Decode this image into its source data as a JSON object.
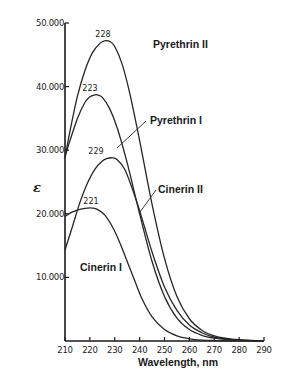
{
  "chart_data": {
    "type": "line",
    "title": "",
    "xlabel": "Wavelength, nm",
    "ylabel": "ε",
    "xlim": [
      210,
      290
    ],
    "ylim": [
      0,
      50000
    ],
    "x_ticks": [
      210,
      220,
      230,
      240,
      250,
      260,
      270,
      280,
      290
    ],
    "x_tick_labels": [
      "210",
      "220",
      "230",
      "240",
      "250",
      "260",
      "270",
      "280",
      "290"
    ],
    "y_ticks": [
      10000,
      20000,
      30000,
      40000,
      50000
    ],
    "y_tick_labels": [
      "10.000",
      "20.000",
      "30.000",
      "40.000",
      "50.000"
    ],
    "grid": false,
    "legend": "inline labels",
    "series": [
      {
        "name": "Pyrethrin II",
        "peak_label": "228",
        "x": [
          210,
          212,
          215,
          218,
          221,
          224,
          226,
          228,
          230,
          233,
          236,
          240,
          245,
          250,
          255,
          260,
          265,
          270,
          275,
          280,
          285,
          290
        ],
        "values": [
          28800,
          33000,
          38500,
          42500,
          45300,
          46800,
          47200,
          47100,
          46300,
          43500,
          39000,
          31500,
          21500,
          13000,
          7000,
          3500,
          1700,
          800,
          400,
          200,
          100,
          50
        ]
      },
      {
        "name": "Pyrethrin I",
        "peak_label": "223",
        "x": [
          210,
          212,
          215,
          218,
          220,
          222,
          223,
          225,
          228,
          231,
          235,
          240,
          245,
          250,
          255,
          260,
          265,
          270,
          275,
          280,
          285,
          290
        ],
        "values": [
          29000,
          31500,
          35000,
          37500,
          38400,
          38700,
          38700,
          38300,
          36500,
          33500,
          28000,
          20000,
          12500,
          7000,
          3600,
          1800,
          900,
          450,
          220,
          100,
          50,
          20
        ]
      },
      {
        "name": "Cinerin II",
        "peak_label": "229",
        "x": [
          210,
          213,
          216,
          219,
          222,
          225,
          227,
          229,
          231,
          234,
          237,
          240,
          245,
          250,
          255,
          260,
          265,
          270,
          275,
          280,
          285,
          290
        ],
        "values": [
          14300,
          18000,
          21800,
          24800,
          27000,
          28300,
          28700,
          28800,
          28500,
          27000,
          24000,
          20500,
          14000,
          8500,
          4800,
          2500,
          1300,
          600,
          300,
          150,
          70,
          30
        ]
      },
      {
        "name": "Cinerin I",
        "peak_label": "221",
        "x": [
          210,
          213,
          216,
          219,
          221,
          223,
          226,
          229,
          232,
          235,
          238,
          241,
          245,
          250,
          255,
          260,
          265,
          270,
          275,
          280,
          285,
          290
        ],
        "values": [
          19600,
          20300,
          20700,
          20900,
          20900,
          20700,
          19800,
          18000,
          15500,
          12500,
          9500,
          6600,
          3800,
          1800,
          800,
          350,
          150,
          70,
          30,
          15,
          8,
          4
        ]
      }
    ]
  },
  "caption_fragment": ""
}
